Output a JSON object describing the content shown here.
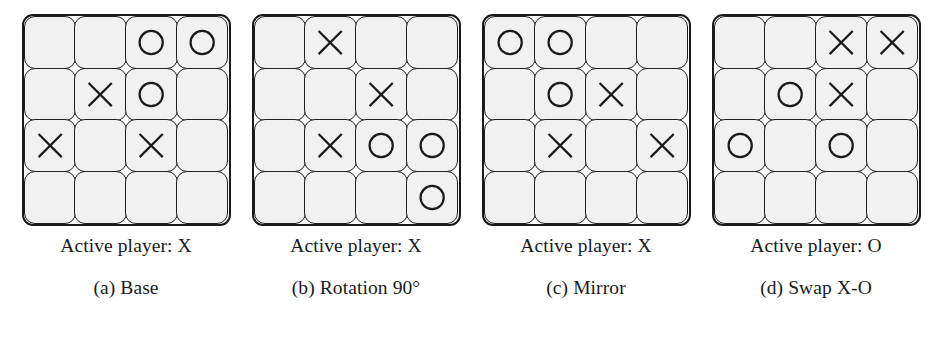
{
  "figure": {
    "background_color": "#ffffff",
    "cell_fill_color": "#f1f1f1",
    "line_color": "#1a1a1a",
    "grid_rows": 4,
    "grid_cols": 4,
    "empty_symbol": "",
    "x_symbol": "X",
    "o_symbol": "O",
    "active_player_prefix": "Active player: "
  },
  "panels": [
    {
      "key": "base",
      "active_label": "Active player: X",
      "active_player": "X",
      "sub_caption": "(a) Base",
      "sub_label": "(a)",
      "sub_name": "Base",
      "board": [
        [
          "",
          "",
          "O",
          "O"
        ],
        [
          "",
          "X",
          "O",
          ""
        ],
        [
          "X",
          "",
          "X",
          ""
        ],
        [
          "",
          "",
          "",
          ""
        ]
      ]
    },
    {
      "key": "rotation-90",
      "active_label": "Active player: X",
      "active_player": "X",
      "sub_caption": "(b) Rotation 90°",
      "sub_label": "(b)",
      "sub_name": "Rotation 90°",
      "board": [
        [
          "",
          "X",
          "",
          ""
        ],
        [
          "",
          "",
          "X",
          ""
        ],
        [
          "",
          "X",
          "O",
          "O"
        ],
        [
          "",
          "",
          "",
          "O"
        ]
      ]
    },
    {
      "key": "mirror",
      "active_label": "Active player: X",
      "active_player": "X",
      "sub_caption": "(c) Mirror",
      "sub_label": "(c)",
      "sub_name": "Mirror",
      "board": [
        [
          "O",
          "O",
          "",
          ""
        ],
        [
          "",
          "O",
          "X",
          ""
        ],
        [
          "",
          "X",
          "",
          "X"
        ],
        [
          "",
          "",
          "",
          ""
        ]
      ]
    },
    {
      "key": "swap-x-o",
      "active_label": "Active player: O",
      "active_player": "O",
      "sub_caption": "(d) Swap X-O",
      "sub_label": "(d)",
      "sub_name": "Swap X-O",
      "board": [
        [
          "",
          "",
          "X",
          "X"
        ],
        [
          "",
          "O",
          "X",
          ""
        ],
        [
          "O",
          "",
          "O",
          ""
        ],
        [
          "",
          "",
          "",
          ""
        ]
      ]
    }
  ]
}
